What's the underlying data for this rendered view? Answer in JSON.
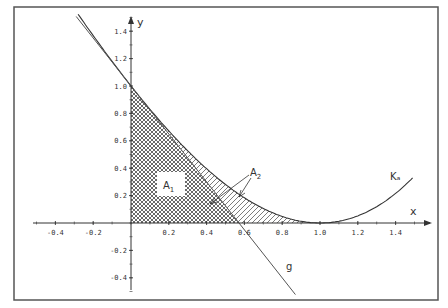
{
  "diagram": {
    "axes": {
      "x_label": "x",
      "y_label": "y",
      "x_ticks": [
        "-0.4",
        "-0.2",
        "0.2",
        "0.4",
        "0.6",
        "0.8",
        "1.0",
        "1.2",
        "1.4"
      ],
      "x_tick_values": [
        -0.4,
        -0.2,
        0.2,
        0.4,
        0.6,
        0.8,
        1.0,
        1.2,
        1.4
      ],
      "y_ticks": [
        "1.4",
        "1.2",
        "1.0",
        "0.8",
        "0.6",
        "0.4",
        "0.2",
        "-0.2",
        "-0.4"
      ],
      "y_tick_values": [
        1.4,
        1.2,
        1.0,
        0.8,
        0.6,
        0.4,
        0.2,
        -0.2,
        -0.4
      ],
      "x_range": [
        -0.5,
        1.5
      ],
      "y_range": [
        -0.5,
        1.5
      ]
    },
    "curves": {
      "curve_label": "Kₐ",
      "line_label": "g"
    },
    "regions": {
      "region1_label": "A",
      "region1_sub": "1",
      "region2_label": "A",
      "region2_sub": "2"
    },
    "colors": {
      "frame": "#555555",
      "ink": "#333333",
      "background": "#ffffff"
    }
  }
}
